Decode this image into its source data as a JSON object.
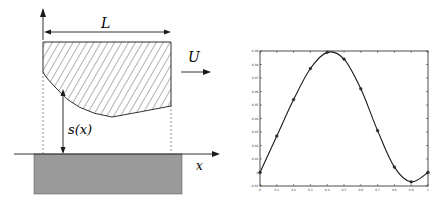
{
  "diagram": {
    "labels": {
      "length": "L",
      "velocity": "U",
      "gap": "s(x)",
      "axis": "x"
    },
    "colors": {
      "ground_fill": "#9a9a9a",
      "line": "#1a1a1a"
    }
  },
  "chart_data": {
    "type": "line",
    "title": "",
    "xlabel": "",
    "ylabel": "",
    "x": [
      0,
      0.1,
      0.2,
      0.3,
      0.4,
      0.5,
      0.6,
      0.7,
      0.8,
      0.9,
      1.0
    ],
    "series": [
      {
        "name": "s(x)",
        "values": [
          0,
          0.027,
          0.054,
          0.077,
          0.089,
          0.084,
          0.062,
          0.031,
          0.004,
          -0.007,
          0
        ]
      }
    ],
    "xlim": [
      0,
      1
    ],
    "ylim": [
      -0.01,
      0.09
    ],
    "xticks": [
      "0",
      "0.1",
      "0.2",
      "0.3",
      "0.4",
      "0.5",
      "0.6",
      "0.7",
      "0.8",
      "0.9",
      "1"
    ],
    "yticks": [
      "-0.01",
      "0",
      "0.01",
      "0.02",
      "0.03",
      "0.04",
      "0.05",
      "0.06",
      "0.07",
      "0.08",
      "0.09"
    ],
    "grid": false,
    "markers": true
  }
}
